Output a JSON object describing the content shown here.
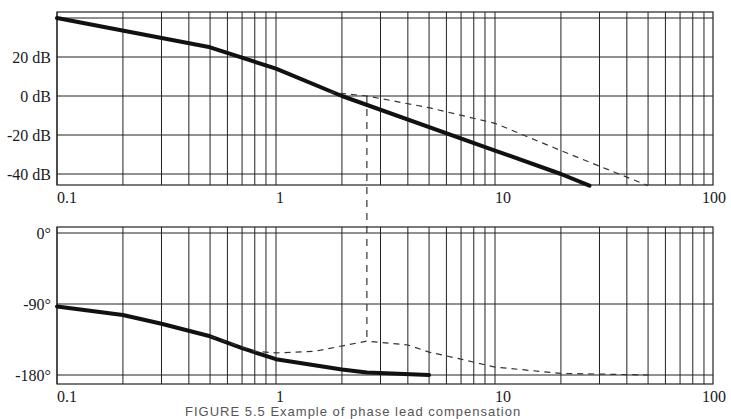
{
  "figure": {
    "caption": "FIGURE 5.5  Example of phase lead compensation"
  },
  "chart_data": [
    {
      "type": "line",
      "title": "Bode magnitude",
      "xscale": "log",
      "xlim": [
        0.1,
        100
      ],
      "x_tick_labels": [
        "0.1",
        "1",
        "10",
        "100"
      ],
      "ylim": [
        -45,
        43
      ],
      "y_ticks": [
        40,
        20,
        0,
        -20,
        -40
      ],
      "y_tick_labels": [
        "",
        "20 dB",
        "0 dB",
        "-20 dB",
        "-40 dB"
      ],
      "ylabel": "dB",
      "grid": true,
      "series": [
        {
          "name": "uncompensated",
          "style": "solid-thick",
          "x": [
            0.1,
            0.5,
            1,
            2,
            10,
            20,
            27
          ],
          "y": [
            40,
            25,
            14,
            0,
            -28,
            -40,
            -46
          ]
        },
        {
          "name": "compensated",
          "style": "dashed",
          "x": [
            1.75,
            2.6,
            5,
            10,
            20,
            50
          ],
          "y": [
            2,
            0,
            -6,
            -14,
            -28,
            -46
          ]
        }
      ],
      "annotations": [
        {
          "type": "vertical-dashed",
          "x": 2.6,
          "label": "crossover frequency"
        }
      ]
    },
    {
      "type": "line",
      "title": "Bode phase",
      "xscale": "log",
      "xlim": [
        0.1,
        100
      ],
      "x_tick_labels": [
        "0.1",
        "1",
        "10",
        "100"
      ],
      "ylim": [
        -192,
        8
      ],
      "y_ticks": [
        0,
        -90,
        -180
      ],
      "y_tick_labels": [
        "0°",
        "-90°",
        "-180°"
      ],
      "ylabel": "degrees",
      "grid": true,
      "series": [
        {
          "name": "uncompensated",
          "style": "solid-thick",
          "x": [
            0.1,
            0.2,
            0.3,
            0.5,
            0.7,
            1,
            2,
            2.6,
            5
          ],
          "y": [
            -93,
            -104,
            -115,
            -131,
            -146,
            -160,
            -173,
            -177,
            -180
          ]
        },
        {
          "name": "compensated",
          "style": "dashed",
          "x": [
            0.5,
            0.8,
            1,
            1.5,
            2.6,
            4,
            5,
            7,
            10,
            20,
            50
          ],
          "y": [
            -131,
            -150,
            -152,
            -150,
            -137,
            -142,
            -151,
            -160,
            -170,
            -178,
            -180
          ]
        }
      ]
    }
  ]
}
